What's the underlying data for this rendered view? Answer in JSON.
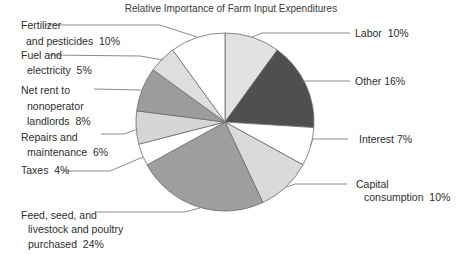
{
  "chart_data": {
    "type": "pie",
    "title": "Relative Importance of Farm Input Expenditures",
    "start_angle_deg": 0,
    "direction": "clockwise",
    "legend_position": "none",
    "slices": [
      {
        "label": "Labor",
        "pct": 10,
        "color": "#e2e2e2"
      },
      {
        "label": "Other",
        "pct": 16,
        "color": "#4f4f4f"
      },
      {
        "label": "Interest",
        "pct": 7,
        "color": "#ffffff"
      },
      {
        "label": "Capital consumption",
        "pct": 10,
        "color": "#dadada"
      },
      {
        "label": "Feed, seed, and livestock and poultry purchased",
        "pct": 24,
        "color": "#9e9e9e"
      },
      {
        "label": "Taxes",
        "pct": 4,
        "color": "#ffffff"
      },
      {
        "label": "Repairs and maintenance",
        "pct": 6,
        "color": "#d6d6d6"
      },
      {
        "label": "Net rent to nonoperator landlords",
        "pct": 8,
        "color": "#9c9c9c"
      },
      {
        "label": "Fuel and electricity",
        "pct": 5,
        "color": "#dedede"
      },
      {
        "label": "Fertilizer and pesticides",
        "pct": 10,
        "color": "#ffffff"
      }
    ]
  },
  "callouts": {
    "fertilizer": {
      "line1": "Fertilizer",
      "line2": "and pesticides  10%"
    },
    "fuel": {
      "line1": "Fuel and",
      "line2": "electricity  5%"
    },
    "net_rent": {
      "line1": "Net rent to",
      "line2": "nonoperator",
      "line3": "landlords  8%"
    },
    "repairs": {
      "line1": "Repairs and",
      "line2": "maintenance  6%"
    },
    "taxes": {
      "line1": "Taxes  4%"
    },
    "feed": {
      "line1": "Feed, seed, and",
      "line2": "livestock and poultry",
      "line3": "purchased  24%"
    },
    "labor": {
      "line1": "Labor  10%"
    },
    "other": {
      "line1": "Other 16%"
    },
    "interest": {
      "line1": "Interest 7%"
    },
    "capital": {
      "line1": "Capital",
      "line2": "consumption  10%"
    }
  }
}
